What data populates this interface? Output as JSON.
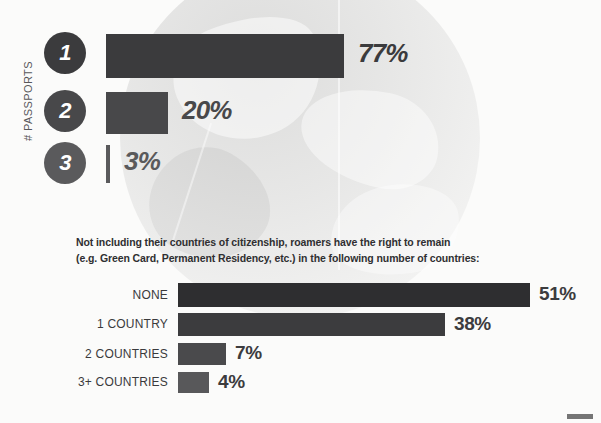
{
  "background": {
    "page_color": "#fbfbfa",
    "watermark": "faint grayscale photographic map watermark circle"
  },
  "top_chart": {
    "axis_label": "# PASSPORTS",
    "bar_origin_px": 106,
    "rows": [
      {
        "badge": "1",
        "label": "1",
        "value": 77,
        "value_label": "77%",
        "bar_px": 238,
        "bar_color": "#3b3b3d",
        "badge_color": "#3b3b3d",
        "value_color": "#3b3b3d"
      },
      {
        "badge": "2",
        "label": "2",
        "value": 20,
        "value_label": "20%",
        "bar_px": 62,
        "bar_color": "#48484a",
        "badge_color": "#48484a",
        "value_color": "#48484a"
      },
      {
        "badge": "3",
        "label": "3",
        "value": 3,
        "value_label": "3%",
        "bar_px": 4,
        "bar_color": "#5a5a5c",
        "badge_color": "#5a5a5c",
        "value_color": "#5a5a5c"
      }
    ]
  },
  "caption": {
    "line1": "Not including their countries of citizenship, roamers have the right to remain",
    "line2": "(e.g. Green Card, Permanent Residency, etc.) in the following number of countries:"
  },
  "bottom_chart": {
    "bar_origin_px": 178,
    "rows": [
      {
        "label": "NONE",
        "value": 51,
        "value_label": "51%",
        "bar_px": 352,
        "bar_color": "#2e2e30"
      },
      {
        "label": "1 COUNTRY",
        "value": 38,
        "value_label": "38%",
        "bar_px": 267,
        "bar_color": "#3c3c3e"
      },
      {
        "label": "2 COUNTRIES",
        "value": 7,
        "value_label": "7%",
        "bar_px": 48,
        "bar_color": "#4a4a4c"
      },
      {
        "label": "3+ COUNTRIES",
        "value": 4,
        "value_label": "4%",
        "bar_px": 31,
        "bar_color": "#58585a"
      }
    ]
  },
  "chart_data": [
    {
      "type": "bar",
      "orientation": "horizontal",
      "title": "",
      "xlabel": "",
      "ylabel": "# PASSPORTS",
      "categories": [
        "1",
        "2",
        "3"
      ],
      "values": [
        77,
        20,
        3
      ],
      "data_labels": [
        "77%",
        "20%",
        "3%"
      ],
      "units": "percent",
      "xlim": [
        0,
        100
      ],
      "grid": false,
      "legend": "none"
    },
    {
      "type": "bar",
      "orientation": "horizontal",
      "title": "Not including their countries of citizenship, roamers have the right to remain (e.g. Green Card, Permanent Residency, etc.) in the following number of countries:",
      "xlabel": "",
      "ylabel": "",
      "categories": [
        "NONE",
        "1 COUNTRY",
        "2 COUNTRIES",
        "3+ COUNTRIES"
      ],
      "values": [
        51,
        38,
        7,
        4
      ],
      "data_labels": [
        "51%",
        "38%",
        "7%",
        "4%"
      ],
      "units": "percent",
      "xlim": [
        0,
        100
      ],
      "grid": false,
      "legend": "none"
    }
  ]
}
